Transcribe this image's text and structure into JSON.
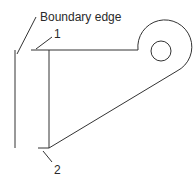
{
  "diagram": {
    "labels": {
      "boundary_edge": "Boundary edge",
      "point_1": "1",
      "point_2": "2"
    },
    "colors": {
      "line": "#333333",
      "text": "#2a2a2a",
      "background": "#ffffff"
    }
  }
}
